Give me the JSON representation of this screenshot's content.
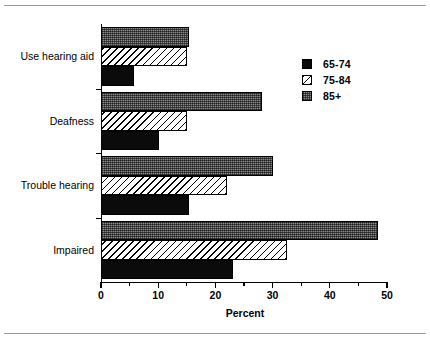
{
  "chart_data": {
    "type": "bar",
    "orientation": "horizontal",
    "title": "",
    "xlabel": "Percent",
    "ylabel": "",
    "xlim": [
      0,
      50
    ],
    "xticks": [
      0,
      10,
      20,
      30,
      40,
      50
    ],
    "xticklabels": [
      "0",
      "10",
      "20",
      "30",
      "40",
      "50"
    ],
    "minor_xticks": [
      5,
      15,
      25,
      35,
      45
    ],
    "grid": false,
    "legend_position": "upper right",
    "categories": [
      "Use hearing aid",
      "Deafness",
      "Trouble hearing",
      "Impaired"
    ],
    "series": [
      {
        "name": "65-74",
        "values": [
          5.7,
          10.2,
          15.3,
          23.0
        ],
        "pattern": "solid-black",
        "color": "#0b0b0b"
      },
      {
        "name": "75-84",
        "values": [
          15.0,
          15.0,
          22.0,
          32.5
        ],
        "pattern": "diagonal-hatch",
        "color": "#ffffff"
      },
      {
        "name": "85+",
        "values": [
          15.4,
          28.2,
          30.0,
          48.5
        ],
        "pattern": "grey-stipple",
        "color": "#8c8c8c"
      }
    ]
  },
  "legend": {
    "items": [
      {
        "label": "65-74"
      },
      {
        "label": "75-84"
      },
      {
        "label": "85+"
      }
    ]
  },
  "axes": {
    "x_title": "Percent",
    "x_ticklabels": [
      "0",
      "10",
      "20",
      "30",
      "40",
      "50"
    ],
    "y_ticklabels": [
      "Use hearing aid",
      "Deafness",
      "Trouble hearing",
      "Impaired"
    ]
  }
}
